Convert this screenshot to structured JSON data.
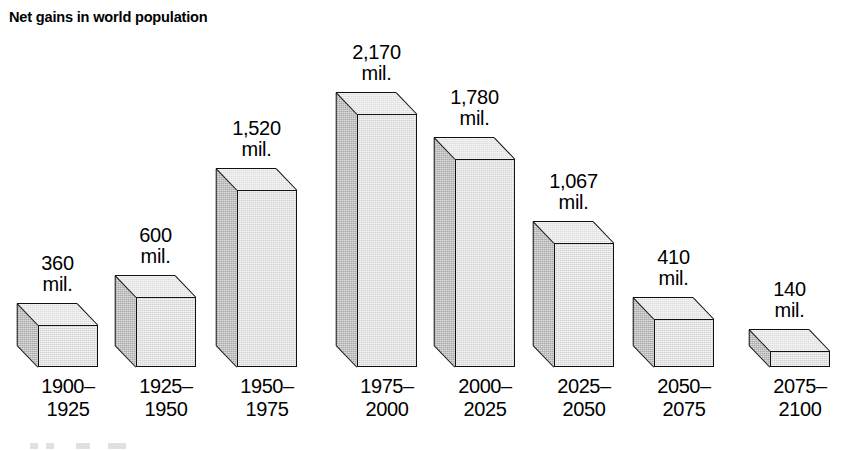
{
  "chart_data": {
    "type": "bar",
    "title": "Net gains in world population",
    "xlabel": "",
    "ylabel": "",
    "unit": "mil.",
    "grid": false,
    "legend": "none",
    "three_d": true,
    "ylim": [
      0,
      2170
    ],
    "categories": [
      "1900–1925",
      "1925–1950",
      "1950–1975",
      "1975–2000",
      "2000–2025",
      "2025–2050",
      "2050–2075",
      "2075–2100"
    ],
    "values": [
      360,
      600,
      1520,
      2170,
      1780,
      1067,
      410,
      140
    ],
    "value_labels": [
      "360",
      "600",
      "1,520",
      "2,170",
      "1,780",
      "1,067",
      "410",
      "140"
    ]
  },
  "header": {
    "title": "Net gains in world population"
  },
  "bars": [
    {
      "value_num": "360",
      "value_unit": "mil.",
      "cat_line1": "1900–",
      "cat_line2": "1925"
    },
    {
      "value_num": "600",
      "value_unit": "mil.",
      "cat_line1": "1925–",
      "cat_line2": "1950"
    },
    {
      "value_num": "1,520",
      "value_unit": "mil.",
      "cat_line1": "1950–",
      "cat_line2": "1975"
    },
    {
      "value_num": "2,170",
      "value_unit": "mil.",
      "cat_line1": "1975–",
      "cat_line2": "2000"
    },
    {
      "value_num": "1,780",
      "value_unit": "mil.",
      "cat_line1": "2000–",
      "cat_line2": "2025"
    },
    {
      "value_num": "1,067",
      "value_unit": "mil.",
      "cat_line1": "2025–",
      "cat_line2": "2050"
    },
    {
      "value_num": "410",
      "value_unit": "mil.",
      "cat_line1": "2050–",
      "cat_line2": "2075"
    },
    {
      "value_num": "140",
      "value_unit": "mil.",
      "cat_line1": "2075–",
      "cat_line2": "2100"
    }
  ],
  "colors": {
    "front_face": "#d2d2d2",
    "side_face": "#a9a9a9",
    "top_face": "#dedede",
    "outline": "#111111",
    "background": "#ffffff",
    "text": "#000000"
  }
}
